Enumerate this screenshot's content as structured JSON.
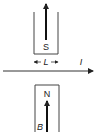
{
  "diagram": {
    "top_magnet": {
      "pole_label": "S"
    },
    "bottom_magnet": {
      "pole_label": "N"
    },
    "width_label": "L",
    "current_label": "I",
    "field_label": "B",
    "colors": {
      "stroke": "#333333",
      "background": "#ffffff"
    }
  }
}
